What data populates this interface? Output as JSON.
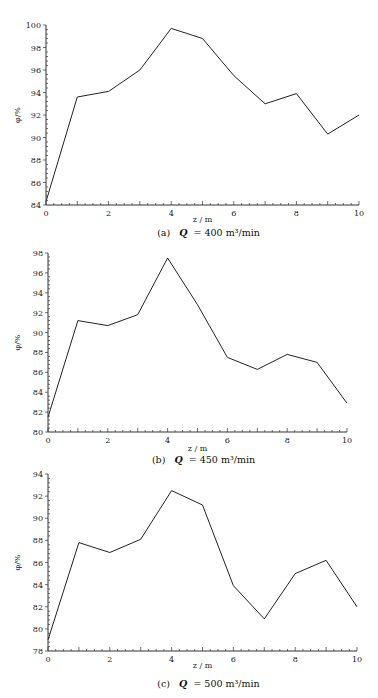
{
  "chart_data": [
    {
      "id": "a",
      "type": "line",
      "caption": "(a)  Q = 400  m³/min",
      "caption_prefix": "(a)",
      "caption_q": "Q",
      "caption_value": "= 400  m³/min",
      "xlabel": "z / m",
      "ylabel": "φ/%",
      "x": [
        0,
        1,
        2,
        3,
        4,
        5,
        6,
        7,
        8,
        9,
        10
      ],
      "values": [
        84.3,
        93.6,
        94.1,
        96.0,
        99.7,
        98.8,
        95.5,
        93.0,
        93.9,
        90.3,
        92.0
      ],
      "values_estimated": true,
      "xlim": [
        0,
        10
      ],
      "ylim": [
        84,
        100
      ],
      "xticks": [
        0,
        2,
        4,
        6,
        8,
        10
      ],
      "yticks": [
        84,
        86,
        88,
        90,
        92,
        94,
        96,
        98,
        100
      ],
      "grid": false,
      "legend": null,
      "frame": {
        "x0": 46,
        "x1": 359,
        "yTop": 25,
        "yBottom": 205,
        "captionY": 236,
        "xlabelY": 222
      }
    },
    {
      "id": "b",
      "type": "line",
      "caption": "(b)  Q = 450  m³/min",
      "caption_prefix": "(b)",
      "caption_q": "Q",
      "caption_value": "= 450  m³/min",
      "xlabel": "z / m",
      "ylabel": "φ/%",
      "x": [
        0,
        1,
        2,
        3,
        4,
        5,
        6,
        7,
        8,
        9,
        10
      ],
      "values": [
        81.5,
        91.2,
        90.7,
        91.8,
        97.5,
        92.8,
        87.5,
        86.3,
        87.8,
        87.0,
        82.9
      ],
      "values_estimated": true,
      "xlim": [
        0,
        10
      ],
      "ylim": [
        80,
        98
      ],
      "xticks": [
        0,
        2,
        4,
        6,
        8,
        10
      ],
      "yticks": [
        80,
        82,
        84,
        86,
        88,
        90,
        92,
        94,
        96,
        98
      ],
      "grid": false,
      "legend": null,
      "frame": {
        "x0": 48,
        "x1": 347,
        "yTop": 253,
        "yBottom": 432,
        "captionY": 463,
        "xlabelY": 451
      }
    },
    {
      "id": "c",
      "type": "line",
      "caption": "(c)  Q = 500  m³/min",
      "caption_prefix": "(c)",
      "caption_q": "Q",
      "caption_value": "= 500  m³/min",
      "xlabel": "z / m",
      "ylabel": "φ/%",
      "x": [
        0,
        1,
        2,
        3,
        4,
        5,
        6,
        7,
        8,
        9,
        10
      ],
      "values": [
        79.0,
        87.8,
        86.9,
        88.1,
        92.5,
        91.2,
        83.9,
        80.9,
        85.0,
        86.2,
        82.0
      ],
      "values_estimated": true,
      "xlim": [
        0,
        10
      ],
      "ylim": [
        78,
        94
      ],
      "xticks": [
        0,
        2,
        4,
        6,
        8,
        10
      ],
      "yticks": [
        78,
        80,
        82,
        84,
        86,
        88,
        90,
        92,
        94
      ],
      "grid": false,
      "legend": null,
      "frame": {
        "x0": 48,
        "x1": 357,
        "yTop": 474,
        "yBottom": 651,
        "captionY": 687,
        "xlabelY": 668
      }
    }
  ]
}
